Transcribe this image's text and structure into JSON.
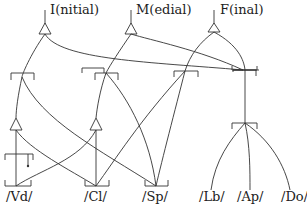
{
  "diagram": {
    "top_labels": {
      "initial": "I(nitial)",
      "medial": "M(edial)",
      "final": "F(inal)"
    },
    "bottom_labels": {
      "vd": "/Vd/",
      "cl": "/Cl/",
      "sp": "/Sp/",
      "lb": "/Lb/",
      "ap": "/Ap/",
      "do": "/Do/"
    },
    "colors": {
      "line": "#333333",
      "text": "#222222",
      "background": "#ffffff"
    }
  }
}
